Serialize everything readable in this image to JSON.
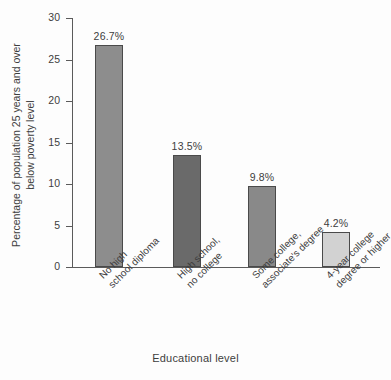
{
  "chart_data": {
    "type": "bar",
    "title": "",
    "subtitle": "",
    "xlabel": "Educational level",
    "ylabel": "Percentage of population 25 years and over below poverty level",
    "ylabel_line1": "Percentage of population 25 years and over",
    "ylabel_line2": "below poverty level",
    "categories": [
      "No high school diploma",
      "High school, no college",
      "Some college, associate's degree",
      "4-year college degree or higher"
    ],
    "category_lines": [
      [
        "No high",
        "school diploma"
      ],
      [
        "High school,",
        "no college"
      ],
      [
        "Some college,",
        "associate's degree"
      ],
      [
        "4-year college",
        "degree or higher"
      ]
    ],
    "values": [
      26.7,
      13.5,
      9.8,
      4.2
    ],
    "value_labels": [
      "26.7%",
      "13.5%",
      "9.8%",
      "4.2%"
    ],
    "bar_colors": [
      "#8d8d8d",
      "#6a6a6a",
      "#898989",
      "#d2d2d2"
    ],
    "bar_border_color": "#4a4a4a",
    "ylim": [
      0,
      30
    ],
    "yticks": [
      0,
      5,
      10,
      15,
      20,
      25,
      30
    ],
    "ytick_labels": [
      "0",
      "5",
      "10",
      "15",
      "20",
      "25",
      "30"
    ],
    "grid": false,
    "legend": false,
    "axis_color": "#5b5b5b",
    "text_color": "#3d3d3d",
    "background": "#fdfdfd"
  }
}
